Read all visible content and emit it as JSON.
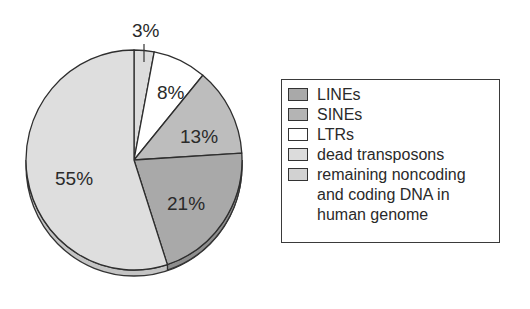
{
  "chart_data": {
    "type": "pie",
    "title": "",
    "start_angle_deg": 0,
    "direction": "clockwise",
    "style": "3d-tilted",
    "slices": [
      {
        "label": "dead transposons",
        "value": 3,
        "display": "3%",
        "color": "#dcdcdc"
      },
      {
        "label": "LTRs",
        "value": 8,
        "display": "8%",
        "color": "#ffffff"
      },
      {
        "label": "SINEs",
        "value": 13,
        "display": "13%",
        "color": "#bdbdbd"
      },
      {
        "label": "LINEs",
        "value": 21,
        "display": "21%",
        "color": "#a9a9a9"
      },
      {
        "label": "remaining noncoding and coding DNA in human genome",
        "value": 55,
        "display": "55%",
        "color": "#dedede"
      }
    ],
    "legend_position": "right"
  },
  "legend": {
    "items": [
      {
        "label": "LINEs",
        "color": "#a9a9a9"
      },
      {
        "label": "SINEs",
        "color": "#bdbdbd"
      },
      {
        "label": "LTRs",
        "color": "#ffffff"
      },
      {
        "label": "dead transposons",
        "color": "#dcdcdc"
      },
      {
        "label": "remaining noncoding\nand coding DNA in\nhuman genome",
        "color": "#d6d6d6"
      }
    ]
  },
  "labels": {
    "s0": "3%",
    "s1": "8%",
    "s2": "13%",
    "s3": "21%",
    "s4": "55%"
  }
}
